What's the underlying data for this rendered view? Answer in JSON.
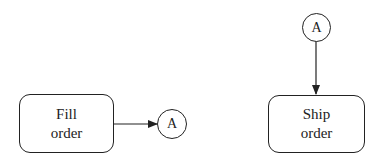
{
  "diagram": {
    "nodes": [
      {
        "id": "fill",
        "type": "process",
        "lines": [
          "Fill",
          "order"
        ]
      },
      {
        "id": "connA_out",
        "type": "off-page-connector",
        "label": "A"
      },
      {
        "id": "connA_in",
        "type": "off-page-connector",
        "label": "A"
      },
      {
        "id": "ship",
        "type": "process",
        "lines": [
          "Ship",
          "order"
        ]
      }
    ],
    "edges": [
      {
        "from": "fill",
        "to": "connA_out"
      },
      {
        "from": "connA_in",
        "to": "ship"
      }
    ]
  }
}
